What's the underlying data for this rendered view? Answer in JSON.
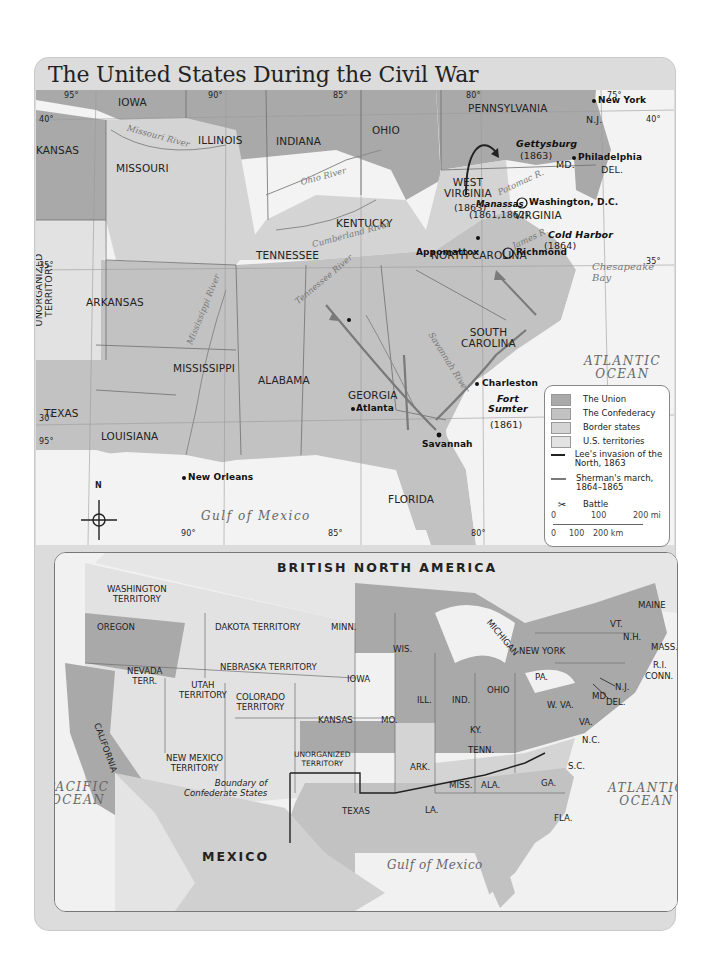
{
  "title": "The United States During the Civil War",
  "colors": {
    "union": "#a9a9a9",
    "confederacy": "#c2c2c2",
    "border_states": "#d4d4d4",
    "territories": "#e2e2e2",
    "water": "#f3f3f3",
    "lee_arrow": "#222222",
    "sherman_arrow": "#7a7a7a"
  },
  "main_map": {
    "longitudes": [
      "95°",
      "90°",
      "85°",
      "80°",
      "75°",
      "90°",
      "85°",
      "80°",
      "95°"
    ],
    "latitudes": [
      "40°",
      "40°",
      "35°",
      "35°",
      "30°"
    ],
    "states": {
      "iowa": "IOWA",
      "illinois": "ILLINOIS",
      "indiana": "INDIANA",
      "ohio": "OHIO",
      "pennsylvania": "PENNSYLVANIA",
      "nj": "N.J.",
      "del": "DEL.",
      "md": "MD.",
      "kansas": "KANSAS",
      "missouri": "MISSOURI",
      "kentucky": "KENTUCKY",
      "west_virginia": "WEST\nVIRGINIA",
      "west_virginia_year": "(1863)",
      "virginia": "VIRGINIA",
      "unorganized": "UNORGANIZED\nTERRITORY",
      "tennessee": "TENNESSEE",
      "north_carolina": "NORTH CAROLINA",
      "arkansas": "ARKANSAS",
      "south_carolina": "SOUTH\nCAROLINA",
      "mississippi": "MISSISSIPPI",
      "alabama": "ALABAMA",
      "georgia": "GEORGIA",
      "texas": "TEXAS",
      "louisiana": "LOUISIANA",
      "florida": "FLORIDA"
    },
    "cities": {
      "new_york": "New York",
      "philadelphia": "Philadelphia",
      "washington": "Washington, D.C.",
      "richmond": "Richmond",
      "appomattox": "Appomattox",
      "atlanta": "Atlanta",
      "savannah": "Savannah",
      "charleston": "Charleston",
      "new_orleans": "New Orleans"
    },
    "battles": {
      "gettysburg": "Gettysburg",
      "gettysburg_year": "(1863)",
      "manassas": "Manassas",
      "manassas_year": "(1861,1862)",
      "cold_harbor": "Cold Harbor",
      "cold_harbor_year": "(1864)",
      "fort_sumter": "Fort\nSumter",
      "fort_sumter_year": "(1861)"
    },
    "rivers": {
      "missouri": "Missouri River",
      "ohio": "Ohio River",
      "cumberland": "Cumberland River",
      "tennessee": "Tennessee River",
      "mississippi": "Mississippi River",
      "savannah": "Savannah River",
      "potomac": "Potomac R.",
      "james": "James R."
    },
    "water": {
      "atlantic": "ATLANTIC\nOCEAN",
      "gulf": "Gulf of Mexico",
      "chesapeake": "Chesapeake\nBay"
    },
    "compass": "N"
  },
  "legend": {
    "items": [
      {
        "label": "The Union",
        "type": "swatch"
      },
      {
        "label": "The Confederacy",
        "type": "swatch"
      },
      {
        "label": "Border states",
        "type": "swatch"
      },
      {
        "label": "U.S. territories",
        "type": "swatch"
      },
      {
        "label": "Lee's invasion of the North, 1863",
        "type": "arrow"
      },
      {
        "label": "Sherman's march, 1864–1865",
        "type": "arrow"
      },
      {
        "label": "Battle",
        "type": "symbol"
      }
    ],
    "scale": {
      "mi_0": "0",
      "mi_100": "100",
      "mi_200": "200 mi",
      "km_0": "0",
      "km_100": "100",
      "km_200": "200 km"
    }
  },
  "inset_map": {
    "title": "BRITISH NORTH AMERICA",
    "regions": {
      "washington": "WASHINGTON\nTERRITORY",
      "oregon": "OREGON",
      "dakota": "DAKOTA TERRITORY",
      "minn": "MINN.",
      "wis": "WIS.",
      "michigan": "MICHIGAN",
      "maine": "MAINE",
      "vt": "VT.",
      "nh": "N.H.",
      "mass": "MASS.",
      "ri": "R.I.",
      "conn": "CONN.",
      "new_york": "NEW YORK",
      "nj": "N.J.",
      "pa": "PA.",
      "md": "MD.",
      "del": "DEL.",
      "ohio": "OHIO",
      "ind": "IND.",
      "ill": "ILL.",
      "iowa": "IOWA",
      "nevada": "NEVADA\nTERR.",
      "utah": "UTAH\nTERRITORY",
      "colorado": "COLORADO\nTERRITORY",
      "nebraska": "NEBRASKA TERRITORY",
      "kansas": "KANSAS",
      "mo": "MO.",
      "ky": "KY.",
      "wva": "W. VA.",
      "va": "VA.",
      "california": "CALIFORNIA",
      "new_mexico": "NEW MEXICO\nTERRITORY",
      "unorganized": "UNORGANIZED\nTERRITORY",
      "tenn": "TENN.",
      "nc": "N.C.",
      "sc": "S.C.",
      "ark": "ARK.",
      "miss": "MISS.",
      "ala": "ALA.",
      "ga": "GA.",
      "la": "LA.",
      "fla": "FLA.",
      "texas": "TEXAS",
      "mexico": "MEXICO"
    },
    "boundary_label": "Boundary of\nConfederate States",
    "water": {
      "pacific": "PACIFIC\nOCEAN",
      "atlantic": "ATLANTIC\nOCEAN",
      "gulf": "Gulf of Mexico"
    }
  }
}
